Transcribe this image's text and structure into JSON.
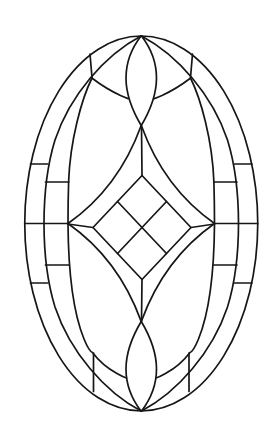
{
  "drawing": {
    "title": "stained-glass-oval-pattern",
    "canvas": {
      "width": 280,
      "height": 447
    },
    "background_color": "#ffffff",
    "stroke_color": "#161616",
    "stroke_width": 1.7,
    "mirror_cx": 141.25,
    "mirror_cy": 223.5,
    "elements": [
      {
        "name": "outer-oval",
        "type": "ellipse",
        "cx": 141.25,
        "cy": 223.5,
        "rx": 116.5,
        "ry": 187.5,
        "mirrors": []
      },
      {
        "name": "inner-oval-left",
        "type": "path",
        "d": "M 141,36 C 105,55 70,95 55,140 C 47,166 44,195 44,223.5 C 44,252 47,281 55,307 C 70,352 105,392 141,411",
        "mirrors": [
          "x"
        ]
      },
      {
        "name": "arch-curve-top-left",
        "type": "path",
        "d": "M 92,78 C 82,98 70,140 68.6,182 C 68.2,196 68,210 68,223.5",
        "mirrors": [
          "x"
        ]
      },
      {
        "name": "petal-round-bottom-left",
        "type": "path",
        "d": "M 68,223.5 C 68.3,268 73,312 84,339 C 87.5,347.5 89.5,351.5 92.5,352.5 C 97,358.5 106,367.5 117,373.5 C 120,375.2 123.3,377 126.5,378",
        "mirrors": [
          "x"
        ]
      },
      {
        "name": "teardrop-diamond-sweep",
        "type": "path",
        "d": "M 141,36 C 131,49 126,63 126,78 C 126,96 132.5,111 141.5,126 Q 164,188 214.5,223.5",
        "mirrors": [
          "x",
          "y",
          "xy"
        ]
      },
      {
        "name": "wing-divider-top-left",
        "type": "path",
        "d": "M 90,54 L 92,77.5",
        "mirrors": [
          "x"
        ]
      },
      {
        "name": "corner-divider-bottom-left",
        "type": "path",
        "d": "M 93.5,353 L 93.5,391.5",
        "mirrors": [
          "x"
        ]
      },
      {
        "name": "wing-base-top-left",
        "type": "path",
        "d": "M 92.5,78.5 C 101,85 112,91.5 120.5,95.5 C 123,96.6 125.8,97.7 128.2,98.6",
        "mirrors": [
          "x"
        ]
      },
      {
        "name": "ring-divider-upper",
        "type": "path",
        "d": "M 30.5,164 L 47.8,164",
        "mirrors": [
          "x",
          "y",
          "xy"
        ]
      },
      {
        "name": "ring-divider-mid",
        "type": "path",
        "d": "M 45.5,182 L 68.8,182",
        "mirrors": [
          "x",
          "y",
          "xy"
        ]
      },
      {
        "name": "ring-divider-center",
        "type": "path",
        "d": "M 24.8,223.5 L 68,223.5",
        "mirrors": [
          "x"
        ]
      },
      {
        "name": "center-square",
        "type": "path",
        "d": "M 142,175.5 L 191,227.5 L 142,279.5 L 93,227.5 Z",
        "mirrors": []
      },
      {
        "name": "square-grid-line-a",
        "type": "path",
        "d": "M 117.5,201.5 L 166.5,253.5",
        "mirrors": []
      },
      {
        "name": "square-grid-line-b",
        "type": "path",
        "d": "M 166.5,201.5 L 117.5,253.5",
        "mirrors": []
      },
      {
        "name": "connector-top",
        "type": "path",
        "d": "M 141.5,126 L 142,175.5",
        "mirrors": []
      },
      {
        "name": "connector-bottom",
        "type": "path",
        "d": "M 142,279.5 L 141.5,321",
        "mirrors": []
      },
      {
        "name": "connector-left",
        "type": "path",
        "d": "M 68,224 L 93,227.5",
        "mirrors": []
      },
      {
        "name": "connector-right",
        "type": "path",
        "d": "M 191,227.5 L 214.5,224",
        "mirrors": []
      }
    ]
  }
}
